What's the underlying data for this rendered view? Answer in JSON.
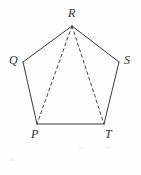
{
  "figure": {
    "kind": "geometry-diagram",
    "shape_name": "pentagon",
    "background_color": "#fefefe",
    "stroke_color": "#3a3a40",
    "stroke_width": 1,
    "dashed_stroke_color": "#45454b",
    "dash_pattern": "3,3",
    "label_color": "#2e2e33"
  },
  "labels": {
    "r": "R",
    "q": "Q",
    "s": "S",
    "p": "P",
    "t": "T"
  },
  "chart_data": {
    "type": "scatter",
    "title": "",
    "xlabel": "",
    "ylabel": "",
    "xlim": [
      0,
      141
    ],
    "ylim": [
      175,
      0
    ],
    "grid": false,
    "legend": "none",
    "vertices": [
      {
        "name": "R",
        "x": 72,
        "y": 26,
        "label_x": 68,
        "label_y": 7
      },
      {
        "name": "Q",
        "x": 23,
        "y": 62,
        "label_x": 9,
        "label_y": 54
      },
      {
        "name": "S",
        "x": 119,
        "y": 62,
        "label_x": 124,
        "label_y": 54
      },
      {
        "name": "P",
        "x": 37,
        "y": 124,
        "label_x": 31,
        "label_y": 128
      },
      {
        "name": "T",
        "x": 104,
        "y": 124,
        "label_x": 105,
        "label_y": 128
      }
    ],
    "solid_edges": [
      {
        "from": "Q",
        "to": "R"
      },
      {
        "from": "R",
        "to": "S"
      },
      {
        "from": "S",
        "to": "T"
      },
      {
        "from": "T",
        "to": "P"
      },
      {
        "from": "P",
        "to": "Q"
      }
    ],
    "dashed_edges": [
      {
        "from": "R",
        "to": "P"
      },
      {
        "from": "R",
        "to": "T"
      }
    ]
  }
}
